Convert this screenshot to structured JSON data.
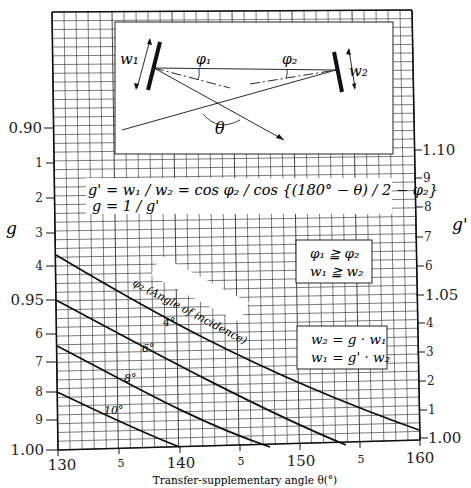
{
  "chart_data": {
    "type": "line",
    "title": "",
    "xlabel": "Transfer-supplementary angle θ(°)",
    "ylabel_left": "g",
    "ylabel_right": "g'",
    "xlim": [
      130,
      160
    ],
    "ylim_left": [
      0.9,
      1.0
    ],
    "ylim_right": [
      1.0,
      1.1
    ],
    "grid": true,
    "x_ticks": [
      {
        "value": 130,
        "label": "130"
      },
      {
        "value": 135,
        "label": "5"
      },
      {
        "value": 140,
        "label": "140"
      },
      {
        "value": 145,
        "label": "5"
      },
      {
        "value": 150,
        "label": "150"
      },
      {
        "value": 155,
        "label": "5"
      },
      {
        "value": 160,
        "label": "160"
      }
    ],
    "y_left_ticks": [
      {
        "label": "0.90"
      },
      {
        "label": "1"
      },
      {
        "label": "2"
      },
      {
        "label": "3"
      },
      {
        "label": "4"
      },
      {
        "label": "0.95"
      },
      {
        "label": "6"
      },
      {
        "label": "7"
      },
      {
        "label": "8"
      },
      {
        "label": "9"
      },
      {
        "label": "1.00"
      }
    ],
    "y_right_ticks": [
      {
        "label": "1.10"
      },
      {
        "label": "9"
      },
      {
        "label": "8"
      },
      {
        "label": "7"
      },
      {
        "label": "6"
      },
      {
        "label": "1.05"
      },
      {
        "label": "4"
      },
      {
        "label": "3"
      },
      {
        "label": "2"
      },
      {
        "label": "1"
      },
      {
        "label": "1.00"
      }
    ],
    "series": [
      {
        "name": "4°",
        "x": [
          130,
          140,
          150,
          160
        ],
        "g": [
          0.937,
          0.956,
          0.975,
          0.998
        ]
      },
      {
        "name": "6°",
        "x": [
          130,
          140,
          150,
          157
        ],
        "g": [
          0.95,
          0.969,
          0.988,
          1.0
        ]
      },
      {
        "name": "8°",
        "x": [
          130,
          140,
          147
        ],
        "g": [
          0.964,
          0.985,
          1.0
        ]
      },
      {
        "name": "10°",
        "x": [
          130,
          135,
          140
        ],
        "g": [
          0.98,
          0.991,
          1.0
        ]
      }
    ],
    "curve_family_label": "φ2 (Angle of incidence)",
    "annotations": [
      "g' = w1 / w2 = cos φ2 / cos {(180° − θ)/2 − φ2}",
      "g = 1/g'",
      "φ1 ≧ φ2",
      "w1 ≧ w2",
      "w2 = g · w1",
      "w1 = g' · w2"
    ]
  },
  "labels": {
    "x_axis_title": "Transfer-supplementary angle θ(°)",
    "y_left_title": "g",
    "y_right_title": "g'",
    "formula_line1": "g' = w₁ / w₂ = cos φ₂ / cos {(180° − θ) / 2 − φ₂}",
    "formula_line2": "g = 1 / g'",
    "cond_line1": "φ₁ ≧ φ₂",
    "cond_line2": "w₁ ≧ w₂",
    "rel_line1": "w₂ = g · w₁",
    "rel_line2": "w₁ = g' · w₂",
    "curve_family": "φ₂ (Angle of incidence)",
    "curve_4": "4°",
    "curve_6": "6°",
    "curve_8": "8°",
    "curve_10": "10°",
    "diagram_w1": "w₁",
    "diagram_w2": "w₂",
    "diagram_phi1": "φ₁",
    "diagram_phi2": "φ₂",
    "diagram_theta": "θ",
    "xt_130": "130",
    "xt_135": "5",
    "xt_140": "140",
    "xt_145": "5",
    "xt_150": "150",
    "xt_155": "5",
    "xt_160": "160",
    "yl_090": "0.90",
    "yl_1": "1",
    "yl_2": "2",
    "yl_3": "3",
    "yl_4": "4",
    "yl_095": "0.95",
    "yl_6": "6",
    "yl_7": "7",
    "yl_8": "8",
    "yl_9": "9",
    "yl_100": "1.00",
    "yr_110": "1.10",
    "yr_9": "9",
    "yr_8": "8",
    "yr_7": "7",
    "yr_6": "6",
    "yr_105": "1.05",
    "yr_4": "4",
    "yr_3": "3",
    "yr_2": "2",
    "yr_1": "1",
    "yr_100": "1.00"
  },
  "colors": {
    "line": "#1a1a1a",
    "grid": "#3a3a3a",
    "background": "#ffffff"
  }
}
